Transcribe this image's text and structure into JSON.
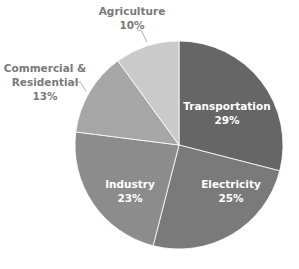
{
  "chart_data": {
    "type": "pie",
    "title": "",
    "start_angle_deg": 0,
    "direction": "clockwise",
    "center": [
      179,
      145
    ],
    "radius": 104,
    "categories": [
      "Transportation",
      "Electricity",
      "Industry",
      "Commercial & Residential",
      "Agriculture"
    ],
    "values": [
      29,
      25,
      23,
      13,
      10
    ],
    "unit": "%",
    "colors": [
      "#666666",
      "#7a7a7a",
      "#8c8c8c",
      "#a6a6a6",
      "#cacaca"
    ],
    "legend": "none",
    "data_labels": [
      {
        "name": "Transportation",
        "line1": "Transportation",
        "line2": "29%",
        "position": "inside",
        "x": 227,
        "y": 113
      },
      {
        "name": "Electricity",
        "line1": "Electricity",
        "line2": "25%",
        "position": "inside",
        "x": 231,
        "y": 191
      },
      {
        "name": "Industry",
        "line1": "Industry",
        "line2": "23%",
        "position": "inside",
        "x": 130,
        "y": 191
      },
      {
        "name": "Commercial & Residential",
        "line1": "Commercial &",
        "line2": "Residential",
        "line3": "13%",
        "position": "outside",
        "x": 45,
        "y": 82
      },
      {
        "name": "Agriculture",
        "line1": "Agriculture",
        "line2": "10%",
        "position": "outside",
        "x": 132,
        "y": 18
      }
    ]
  }
}
